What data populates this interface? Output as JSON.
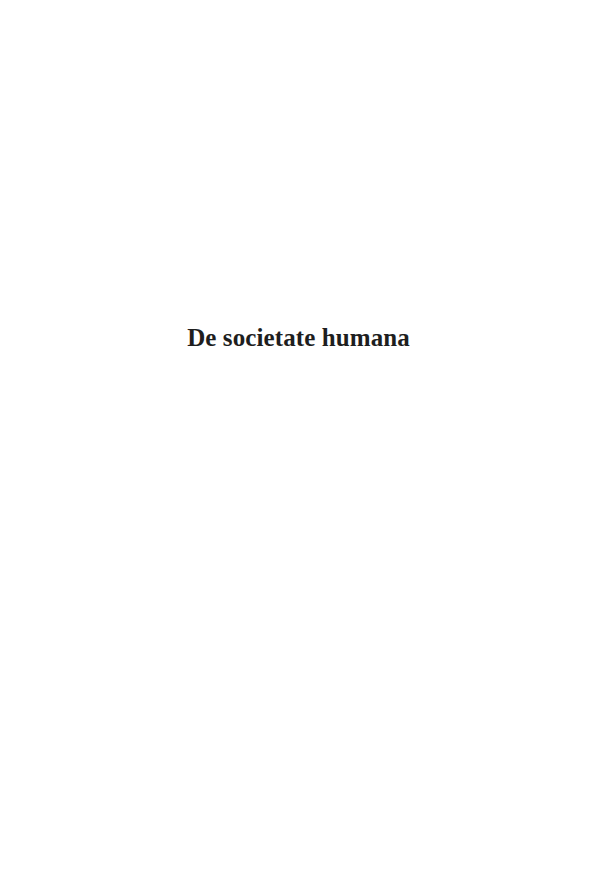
{
  "page": {
    "title": "De societate humana",
    "colors": {
      "background": "#ffffff",
      "text": "#1e1e1e"
    }
  }
}
